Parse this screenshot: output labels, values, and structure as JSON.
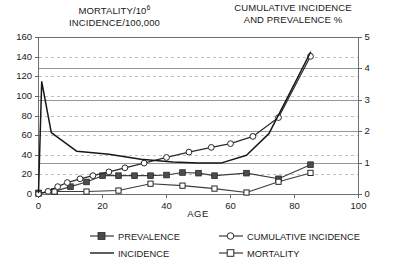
{
  "titles": {
    "left_axis_line1": "MORTALITY/10",
    "left_axis_line1_sup": "6",
    "left_axis_line2": "INCIDENCE/100,000",
    "right_axis_line1": "CUMULATIVE INCIDENCE",
    "right_axis_line2": "AND PREVALENCE %"
  },
  "axes": {
    "x_title": "AGE",
    "x_ticks": [
      "0",
      "20",
      "40",
      "60",
      "80",
      "100"
    ],
    "y_left_ticks": [
      "0",
      "20",
      "40",
      "60",
      "80",
      "100",
      "120",
      "140",
      "160"
    ],
    "y_right_ticks": [
      "0",
      "1",
      "2",
      "3",
      "4",
      "5"
    ]
  },
  "legend": {
    "items": [
      {
        "label": "PREVALENCE",
        "marker": "filled-square-marker",
        "color": "#3a3a3a"
      },
      {
        "label": "CUMULATIVE INCIDENCE",
        "marker": "open-circle-marker",
        "color": "#3a3a3a"
      },
      {
        "label": "INCIDENCE",
        "marker": "plain-line-marker",
        "color": "#1a1a1a"
      },
      {
        "label": "MORTALITY",
        "marker": "open-square-marker",
        "color": "#3a3a3a"
      }
    ]
  },
  "chart_data": {
    "type": "line",
    "title": "",
    "xlabel": "AGE",
    "ylabel": "MORTALITY/10^6  INCIDENCE/100,000",
    "ylabel_secondary": "CUMULATIVE INCIDENCE AND PREVALENCE %",
    "xlim": [
      0,
      100
    ],
    "ylim": [
      0,
      160
    ],
    "ylim_secondary": [
      0,
      5
    ],
    "grid": true,
    "grid_dashed_axis": "left",
    "grid_solid_axis": "right",
    "legend_position": "below",
    "series": [
      {
        "name": "INCIDENCE",
        "axis": "left",
        "marker": "none",
        "x": [
          0,
          1,
          4,
          12,
          22,
          32,
          42,
          50,
          57,
          65,
          72,
          78,
          85
        ],
        "y": [
          2,
          115,
          63,
          44,
          41,
          36,
          33,
          32,
          32,
          40,
          62,
          100,
          145
        ]
      },
      {
        "name": "MORTALITY",
        "axis": "left",
        "marker": "open-square",
        "x": [
          0,
          5,
          15,
          25,
          35,
          45,
          55,
          65,
          75,
          85
        ],
        "y": [
          1,
          3,
          3,
          4,
          11,
          9,
          6,
          2,
          13,
          22
        ]
      },
      {
        "name": "PREVALENCE",
        "axis": "right",
        "marker": "filled-square",
        "x": [
          0,
          5,
          10,
          15,
          20,
          25,
          30,
          35,
          40,
          45,
          50,
          55,
          65,
          75,
          85
        ],
        "y": [
          0.05,
          0.1,
          0.25,
          0.4,
          0.6,
          0.6,
          0.6,
          0.6,
          0.62,
          0.7,
          0.68,
          0.6,
          0.68,
          0.5,
          0.95
        ]
      },
      {
        "name": "CUMULATIVE INCIDENCE",
        "axis": "right",
        "marker": "open-circle",
        "x": [
          0,
          3,
          6,
          9,
          13,
          17,
          22,
          27,
          33,
          40,
          47,
          54,
          60,
          67,
          75,
          85
        ],
        "y": [
          0.02,
          0.1,
          0.25,
          0.38,
          0.5,
          0.6,
          0.72,
          0.85,
          1.0,
          1.18,
          1.35,
          1.5,
          1.62,
          1.85,
          2.45,
          4.4
        ]
      }
    ]
  }
}
